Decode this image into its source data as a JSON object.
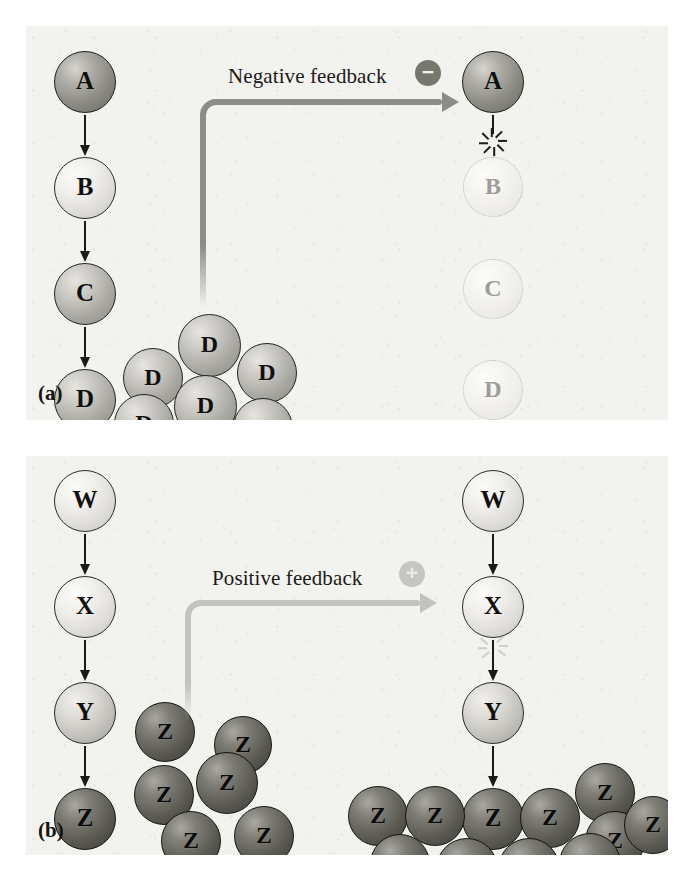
{
  "figure": {
    "panels": [
      {
        "tag": "(a)",
        "mechanism": "Negative feedback",
        "sign": "−",
        "sign_name": "minus",
        "left_pathway": {
          "nodes": [
            "A",
            "B",
            "C",
            "D"
          ],
          "product_cluster_label": "D",
          "product_cluster_count": 6
        },
        "right_pathway": {
          "nodes": [
            "A",
            "B",
            "C",
            "D"
          ],
          "active_nodes": [
            "A"
          ],
          "inhibited_nodes": [
            "B",
            "C",
            "D"
          ],
          "blocked_step": "A to B"
        }
      },
      {
        "tag": "(b)",
        "mechanism": "Positive feedback",
        "sign": "+",
        "sign_name": "plus",
        "left_pathway": {
          "nodes": [
            "W",
            "X",
            "Y",
            "Z"
          ],
          "product_cluster_label": "Z",
          "product_cluster_count": 6
        },
        "right_pathway": {
          "nodes": [
            "W",
            "X",
            "Y",
            "Z"
          ],
          "active_nodes": [
            "W",
            "X",
            "Y",
            "Z"
          ],
          "stimulated_step": "X to Y",
          "product_cluster_label": "Z",
          "product_cluster_count": 10
        }
      }
    ],
    "colors": {
      "panel_background": "#f2f2ef",
      "negative_feedback_arrow": "#8d8c86",
      "positive_feedback_arrow": "#c3c2bd",
      "pathway_arrow": "#1a1916",
      "negative_badge": "#77766f",
      "positive_badge": "#c6c5c0"
    }
  },
  "panel_a": {
    "tag": "(a)",
    "label": "Negative feedback",
    "sign": "−",
    "left": {
      "n0": "A",
      "n1": "B",
      "n2": "C",
      "n3": "D",
      "cluster": [
        "D",
        "D",
        "D",
        "D",
        "D",
        "D"
      ]
    },
    "right": {
      "n0": "A",
      "n1": "B",
      "n2": "C",
      "n3": "D"
    }
  },
  "panel_b": {
    "tag": "(b)",
    "label": "Positive feedback",
    "sign": "+",
    "left": {
      "n0": "W",
      "n1": "X",
      "n2": "Y",
      "n3": "Z",
      "cluster": [
        "Z",
        "Z",
        "Z",
        "Z",
        "Z",
        "Z"
      ]
    },
    "right": {
      "n0": "W",
      "n1": "X",
      "n2": "Y",
      "n3": "Z",
      "cluster": [
        "Z",
        "Z",
        "Z",
        "Z",
        "Z",
        "Z",
        "Z",
        "Z",
        "Z",
        "Z"
      ]
    }
  }
}
